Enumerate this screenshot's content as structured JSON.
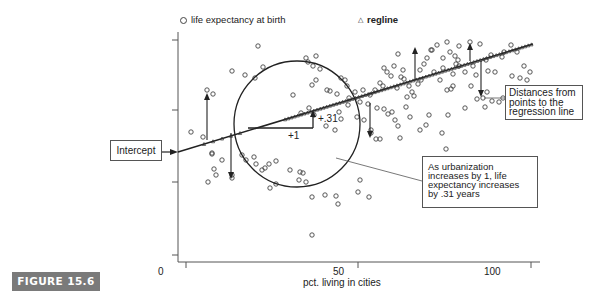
{
  "figure": {
    "label": "FIGURE 15.6"
  },
  "legend": {
    "series1_label": "life expectancy at birth",
    "series1_marker": "circle-marker",
    "series2_label": "regline",
    "series2_marker": "triangle-marker"
  },
  "axes": {
    "x_title": "pct. living in cities",
    "x_ticks": [
      "0",
      "50",
      "100"
    ]
  },
  "annotations": {
    "intercept": "Intercept",
    "distances": [
      "Distances from",
      "points to the",
      "regression line"
    ],
    "slope_note": [
      "As urbanization",
      "increases by 1, life",
      "expectancy increases",
      "by .31 years"
    ],
    "run_label": "+1",
    "rise_label": "+.31"
  },
  "chart_data": {
    "type": "scatter",
    "title": "",
    "xlabel": "pct. living in cities",
    "ylabel": "",
    "xlim": [
      -5,
      110
    ],
    "x_ticks": [
      0,
      50,
      100
    ],
    "legend": [
      "life expectancy at birth",
      "regline"
    ],
    "legend_position": "top",
    "grid": false,
    "regression": {
      "slope": 0.31,
      "label": "regline"
    },
    "series": [
      {
        "name": "life expectancy at birth",
        "marker": "circle",
        "points_px": [
          [
            258,
            46
          ],
          [
            263,
            67
          ],
          [
            232,
            71
          ],
          [
            245,
            75
          ],
          [
            255,
            78
          ],
          [
            207,
            90
          ],
          [
            213,
            94
          ],
          [
            242,
            155
          ],
          [
            222,
            160
          ],
          [
            246,
            160
          ],
          [
            269,
            164
          ],
          [
            276,
            161
          ],
          [
            290,
            170
          ],
          [
            300,
            172
          ],
          [
            303,
            173
          ],
          [
            262,
            170
          ],
          [
            232,
            175
          ],
          [
            265,
            168
          ],
          [
            293,
            95
          ],
          [
            306,
            58
          ],
          [
            308,
            62
          ],
          [
            313,
            66
          ],
          [
            316,
            56
          ],
          [
            320,
            69
          ],
          [
            316,
            80
          ],
          [
            312,
            85
          ],
          [
            327,
            90
          ],
          [
            337,
            94
          ],
          [
            347,
            86
          ],
          [
            330,
            91
          ],
          [
            341,
            78
          ],
          [
            345,
            80
          ],
          [
            349,
            98
          ],
          [
            355,
            92
          ],
          [
            363,
            90
          ],
          [
            360,
            102
          ],
          [
            368,
            104
          ],
          [
            370,
            95
          ],
          [
            375,
            90
          ],
          [
            380,
            83
          ],
          [
            383,
            86
          ],
          [
            387,
            72
          ],
          [
            384,
            68
          ],
          [
            391,
            76
          ],
          [
            394,
            66
          ],
          [
            398,
            54
          ],
          [
            397,
            88
          ],
          [
            401,
            77
          ],
          [
            403,
            70
          ],
          [
            404,
            79
          ],
          [
            409,
            86
          ],
          [
            412,
            92
          ],
          [
            407,
            97
          ],
          [
            406,
            107
          ],
          [
            414,
            96
          ],
          [
            418,
            84
          ],
          [
            420,
            70
          ],
          [
            424,
            64
          ],
          [
            421,
            80
          ],
          [
            427,
            58
          ],
          [
            431,
            50
          ],
          [
            434,
            72
          ],
          [
            440,
            80
          ],
          [
            443,
            68
          ],
          [
            447,
            90
          ],
          [
            451,
            89
          ],
          [
            453,
            74
          ],
          [
            455,
            56
          ],
          [
            458,
            60
          ],
          [
            459,
            66
          ],
          [
            465,
            72
          ],
          [
            471,
            86
          ],
          [
            476,
            75
          ],
          [
            485,
            107
          ],
          [
            392,
            112
          ],
          [
            395,
            120
          ],
          [
            398,
            126
          ],
          [
            410,
            117
          ],
          [
            420,
            130
          ],
          [
            426,
            125
          ],
          [
            429,
            115
          ],
          [
            442,
            133
          ],
          [
            446,
            149
          ],
          [
            371,
            130
          ],
          [
            376,
            139
          ],
          [
            400,
            138
          ],
          [
            377,
            108
          ],
          [
            384,
            109
          ],
          [
            388,
            114
          ],
          [
            448,
            115
          ],
          [
            453,
            86
          ],
          [
            465,
            108
          ],
          [
            477,
            99
          ],
          [
            483,
            98
          ],
          [
            487,
            92
          ],
          [
            492,
            101
          ],
          [
            499,
            102
          ],
          [
            503,
            98
          ],
          [
            509,
            100
          ],
          [
            514,
            104
          ],
          [
            528,
            112
          ],
          [
            524,
            66
          ],
          [
            530,
            72
          ],
          [
            527,
            80
          ],
          [
            520,
            78
          ],
          [
            512,
            76
          ],
          [
            517,
            52
          ],
          [
            502,
            57
          ],
          [
            488,
            71
          ],
          [
            480,
            44
          ],
          [
            470,
            42
          ],
          [
            459,
            46
          ],
          [
            447,
            42
          ],
          [
            437,
            45
          ],
          [
            432,
            50
          ],
          [
            443,
            58
          ],
          [
            450,
            52
          ],
          [
            456,
            64
          ],
          [
            511,
            45
          ],
          [
            504,
            52
          ],
          [
            491,
            55
          ],
          [
            495,
            72
          ],
          [
            486,
            60
          ],
          [
            473,
            66
          ],
          [
            360,
            180
          ],
          [
            358,
            192
          ],
          [
            369,
            197
          ],
          [
            371,
            133
          ],
          [
            380,
            139
          ],
          [
            364,
            120
          ],
          [
            357,
            117
          ],
          [
            339,
            112
          ],
          [
            348,
            105
          ],
          [
            341,
            119
          ],
          [
            335,
            130
          ],
          [
            326,
            126
          ],
          [
            314,
            115
          ],
          [
            301,
            113
          ],
          [
            309,
            108
          ],
          [
            191,
            132
          ],
          [
            203,
            137
          ],
          [
            212,
            154
          ],
          [
            216,
            175
          ],
          [
            214,
            169
          ],
          [
            208,
            182
          ],
          [
            232,
            178
          ],
          [
            254,
            157
          ],
          [
            256,
            164
          ],
          [
            270,
            188
          ],
          [
            276,
            184
          ],
          [
            299,
            180
          ],
          [
            312,
            197
          ],
          [
            338,
            204
          ],
          [
            336,
            196
          ],
          [
            312,
            235
          ],
          [
            325,
            195
          ],
          [
            306,
            182
          ],
          [
            212,
            153
          ]
        ]
      },
      {
        "name": "regline",
        "marker": "triangle",
        "line_px": [
          [
            178,
            152
          ],
          [
            533,
            44
          ]
        ]
      }
    ]
  }
}
